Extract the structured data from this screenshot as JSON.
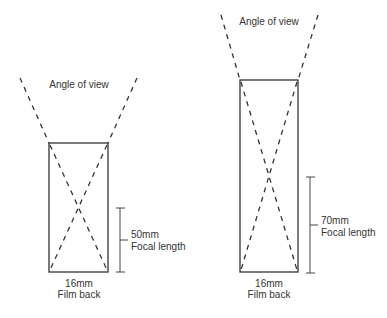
{
  "diagrams": [
    {
      "id": "short-lens",
      "angle_label": "Angle of view",
      "focal_value": "50mm",
      "focal_label": "Focal length",
      "film_value": "16mm",
      "film_label": "Film back"
    },
    {
      "id": "long-lens",
      "angle_label": "Angle of view",
      "focal_value": "70mm",
      "focal_label": "Focal length",
      "film_value": "16mm",
      "film_label": "Film back"
    }
  ],
  "colors": {
    "line": "#333333",
    "background": "#ffffff"
  }
}
